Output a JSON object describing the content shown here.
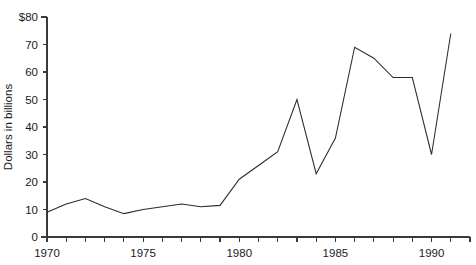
{
  "chart_data": {
    "type": "line",
    "title": "",
    "subtitle": "",
    "xlabel": "",
    "ylabel": "Dollars in billions",
    "xlim": [
      1970,
      1992
    ],
    "ylim": [
      0,
      80
    ],
    "grid": false,
    "legend": false,
    "legend_position": "none",
    "y_ticks": [
      0,
      10,
      20,
      30,
      40,
      50,
      60,
      70,
      80
    ],
    "y_tick_labels": [
      "0",
      "10",
      "20",
      "30",
      "40",
      "50",
      "60",
      "70",
      "$80"
    ],
    "x_ticks": [
      1970,
      1971,
      1972,
      1973,
      1974,
      1975,
      1976,
      1977,
      1978,
      1979,
      1980,
      1981,
      1982,
      1983,
      1984,
      1985,
      1986,
      1987,
      1988,
      1989,
      1990,
      1991,
      1992
    ],
    "x_tick_labels": [
      "1970",
      "",
      "",
      "",
      "",
      "1975",
      "",
      "",
      "",
      "",
      "1980",
      "",
      "",
      "",
      "",
      "1985",
      "",
      "",
      "",
      "",
      "1990",
      "",
      ""
    ],
    "x_labeled_ticks": [
      {
        "value": 1970,
        "label": "1970"
      },
      {
        "value": 1975,
        "label": "1975"
      },
      {
        "value": 1980,
        "label": "1980"
      },
      {
        "value": 1985,
        "label": "1985"
      },
      {
        "value": 1990,
        "label": "1990"
      }
    ],
    "series": [
      {
        "name": "Dollars in billions",
        "color": "#2b2b2b",
        "x": [
          1970,
          1971,
          1972,
          1973,
          1974,
          1975,
          1976,
          1977,
          1978,
          1979,
          1980,
          1981,
          1982,
          1983,
          1984,
          1985,
          1986,
          1987,
          1988,
          1989,
          1990,
          1991
        ],
        "values": [
          9,
          12,
          14,
          11,
          8.5,
          10,
          11,
          12,
          11,
          11.5,
          21,
          26,
          31,
          50,
          23,
          36,
          69,
          65,
          58,
          58,
          30,
          74
        ]
      }
    ]
  },
  "axes": {
    "y_title": "Dollars in billions"
  }
}
